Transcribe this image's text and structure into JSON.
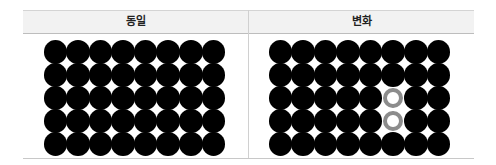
{
  "table": {
    "headers": [
      "동일",
      "변화"
    ]
  },
  "panels": [
    {
      "label": "동일",
      "rows": 5,
      "cols": 8,
      "cells": [
        [
          "filled",
          "filled",
          "filled",
          "filled",
          "filled",
          "filled",
          "filled",
          "filled"
        ],
        [
          "filled",
          "filled",
          "filled",
          "filled",
          "filled",
          "filled",
          "filled",
          "filled"
        ],
        [
          "filled",
          "filled",
          "filled",
          "filled",
          "filled",
          "filled",
          "filled",
          "filled"
        ],
        [
          "filled",
          "filled",
          "filled",
          "filled",
          "filled",
          "filled",
          "filled",
          "filled"
        ],
        [
          "filled",
          "filled",
          "filled",
          "filled",
          "filled",
          "filled",
          "filled",
          "filled"
        ]
      ]
    },
    {
      "label": "변화",
      "rows": 5,
      "cols": 8,
      "cells": [
        [
          "filled",
          "filled",
          "filled",
          "filled",
          "filled",
          "filled",
          "filled",
          "filled"
        ],
        [
          "filled",
          "filled",
          "filled",
          "filled",
          "filled",
          "filled",
          "filled",
          "filled"
        ],
        [
          "filled",
          "filled",
          "filled",
          "filled",
          "filled",
          "hollow",
          "filled",
          "filled"
        ],
        [
          "filled",
          "filled",
          "filled",
          "filled",
          "filled",
          "hollow",
          "filled",
          "filled"
        ],
        [
          "filled",
          "filled",
          "filled",
          "filled",
          "filled",
          "filled",
          "filled",
          "filled"
        ]
      ]
    }
  ],
  "colors": {
    "filled": "#000000",
    "hollow_ring": "#8c8c8c",
    "header_bg": "#f2f2f2"
  }
}
